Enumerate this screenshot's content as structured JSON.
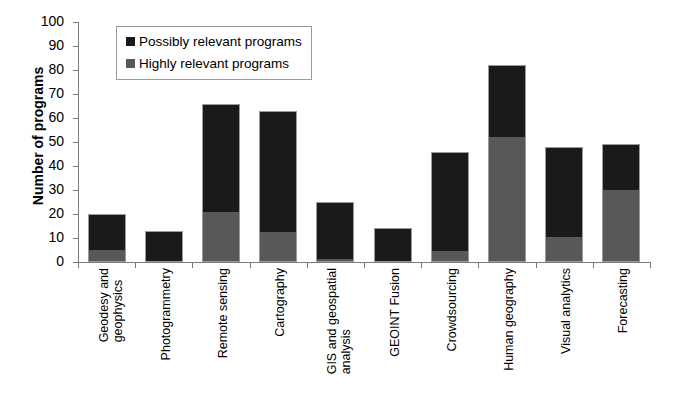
{
  "chart_data": {
    "type": "bar",
    "subtype": "stacked-vertical",
    "title": "",
    "xlabel": "",
    "ylabel": "Number of programs",
    "ylim": [
      0,
      100
    ],
    "ytick_step": 10,
    "yticks": [
      100,
      90,
      80,
      70,
      60,
      50,
      40,
      30,
      20,
      10,
      0
    ],
    "grid": false,
    "legend_position": "top-left-inside",
    "categories": [
      "Geodesy and geophysics",
      "Photogrammetry",
      "Remote sensing",
      "Cartography",
      "GIS and geospatial analysis",
      "GEOINT Fusion",
      "Crowdsourcing",
      "Human geography",
      "Visual analytics",
      "Forecasting"
    ],
    "category_lines": [
      [
        "Geodesy and",
        "geophysics"
      ],
      [
        "Photogrammetry"
      ],
      [
        "Remote sensing"
      ],
      [
        "Cartography"
      ],
      [
        "GIS and geospatial",
        "analysis"
      ],
      [
        "GEOINT Fusion"
      ],
      [
        "Crowdsourcing"
      ],
      [
        "Human geography"
      ],
      [
        "Visual analytics"
      ],
      [
        "Forecasting"
      ]
    ],
    "series": [
      {
        "name": "Highly relevant programs",
        "color": "#585858",
        "values": [
          5,
          0,
          21,
          12,
          1,
          0,
          4,
          52,
          10,
          30
        ]
      },
      {
        "name": "Possibly relevant programs",
        "color": "#1a1a1a",
        "values": [
          15,
          13,
          45,
          51,
          24,
          14,
          42,
          30,
          38,
          19
        ]
      }
    ],
    "totals": [
      20,
      13,
      66,
      63,
      25,
      14,
      46,
      82,
      48,
      49
    ]
  },
  "legend": {
    "items": [
      {
        "label": "Possibly relevant programs",
        "swatch": "possibly"
      },
      {
        "label": "Highly relevant programs",
        "swatch": "highly"
      }
    ]
  },
  "axes": {
    "y_title": "Number of programs",
    "y_tick_labels": [
      "100",
      "90",
      "80",
      "70",
      "60",
      "50",
      "40",
      "30",
      "20",
      "10",
      "0"
    ]
  },
  "colors": {
    "possibly_relevant": "#1a1a1a",
    "highly_relevant": "#585858",
    "axis": "#7a7a7a",
    "bar_border": "#9b9b9b",
    "background": "#ffffff"
  }
}
